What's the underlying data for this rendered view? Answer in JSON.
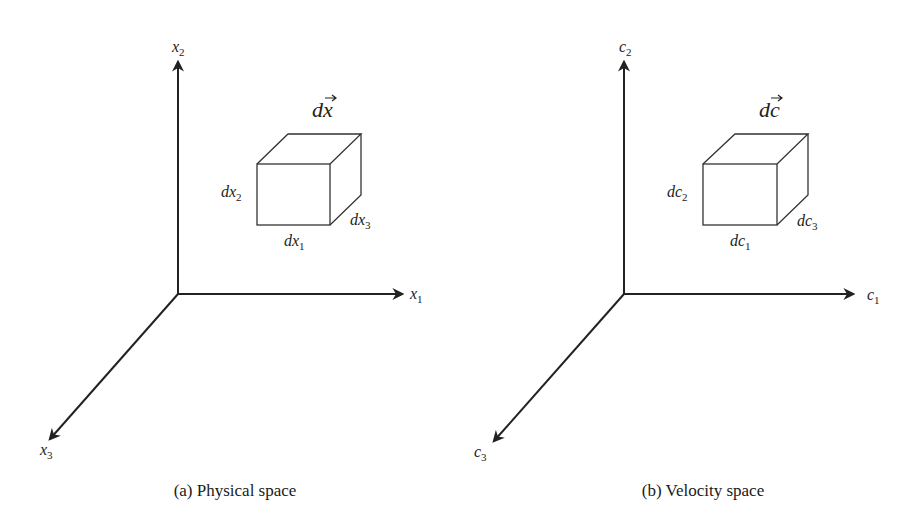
{
  "panels": [
    {
      "id": "a",
      "caption": "(a) Physical space",
      "vector_label": {
        "base": "d",
        "var": "x",
        "arrow": "→"
      },
      "axes": {
        "vertical": {
          "base": "x",
          "sub": "2"
        },
        "horizontal": {
          "base": "x",
          "sub": "1"
        },
        "diagonal": {
          "base": "x",
          "sub": "3"
        }
      },
      "edges": {
        "height": {
          "base": "dx",
          "sub": "2"
        },
        "width": {
          "base": "dx",
          "sub": "1"
        },
        "depth": {
          "base": "dx",
          "sub": "3"
        }
      }
    },
    {
      "id": "b",
      "caption": "(b) Velocity space",
      "vector_label": {
        "base": "d",
        "var": "c",
        "arrow": "→"
      },
      "axes": {
        "vertical": {
          "base": "c",
          "sub": "2"
        },
        "horizontal": {
          "base": "c",
          "sub": "1"
        },
        "diagonal": {
          "base": "c",
          "sub": "3"
        }
      },
      "edges": {
        "height": {
          "base": "dc",
          "sub": "2"
        },
        "width": {
          "base": "dc",
          "sub": "1"
        },
        "depth": {
          "base": "dc",
          "sub": "3"
        }
      }
    }
  ]
}
